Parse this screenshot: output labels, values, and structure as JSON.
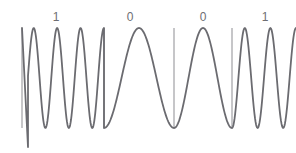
{
  "figure": {
    "name": "fsk-modulation-waveform",
    "background_color": "#ffffff",
    "width": 296,
    "height": 153
  },
  "style": {
    "wave_color": "#6b6b70",
    "wave_stroke_width": 1.8,
    "divider_color": "#8d8d92",
    "divider_stroke_width": 1.0,
    "label_color": "#6e6e73",
    "label_font_size": 12
  },
  "bit_labels": [
    {
      "text": "1",
      "x": 56,
      "y": 11
    },
    {
      "text": "0",
      "x": 130,
      "y": 11
    },
    {
      "text": "0",
      "x": 203,
      "y": 11
    },
    {
      "text": "1",
      "x": 265,
      "y": 11
    }
  ],
  "dividers": [
    {
      "x": 22,
      "y_top": 28,
      "y_bottom": 128
    },
    {
      "x": 104,
      "y_top": 28,
      "y_bottom": 128
    },
    {
      "x": 174,
      "y_top": 28,
      "y_bottom": 128
    },
    {
      "x": 232,
      "y_top": 28,
      "y_bottom": 128
    }
  ],
  "chart_data": {
    "type": "line",
    "title": "",
    "xlabel": "",
    "ylabel": "",
    "grid": false,
    "legend": false,
    "x": [
      0,
      296
    ],
    "ylim": [
      28,
      128
    ],
    "baseline_y": 78,
    "amplitude": 50,
    "symbols": [
      {
        "bit": "1",
        "frequency": "high",
        "x_start": 22,
        "x_end": 104,
        "cycles": 3.5,
        "peak_x": [
          37,
          58,
          79
        ],
        "trough_x": [
          28,
          48,
          69,
          90
        ]
      },
      {
        "bit": "0",
        "frequency": "low",
        "x_start": 104,
        "x_end": 174,
        "cycles": 1.0,
        "peak_x": [
          140
        ],
        "trough_x": [
          105,
          174
        ]
      },
      {
        "bit": "0",
        "frequency": "low",
        "x_start": 174,
        "x_end": 232,
        "cycles": 1.0,
        "peak_x": [
          203
        ],
        "trough_x": [
          174,
          232
        ]
      },
      {
        "bit": "1",
        "frequency": "high",
        "x_start": 232,
        "x_end": 296,
        "cycles": 2.5,
        "peak_x": [
          245,
          273
        ],
        "trough_x": [
          234,
          259,
          287
        ]
      }
    ],
    "lead_in_spike": {
      "x": 28,
      "y_min": 147,
      "note": "initial transient dips below the normal trough level"
    }
  }
}
